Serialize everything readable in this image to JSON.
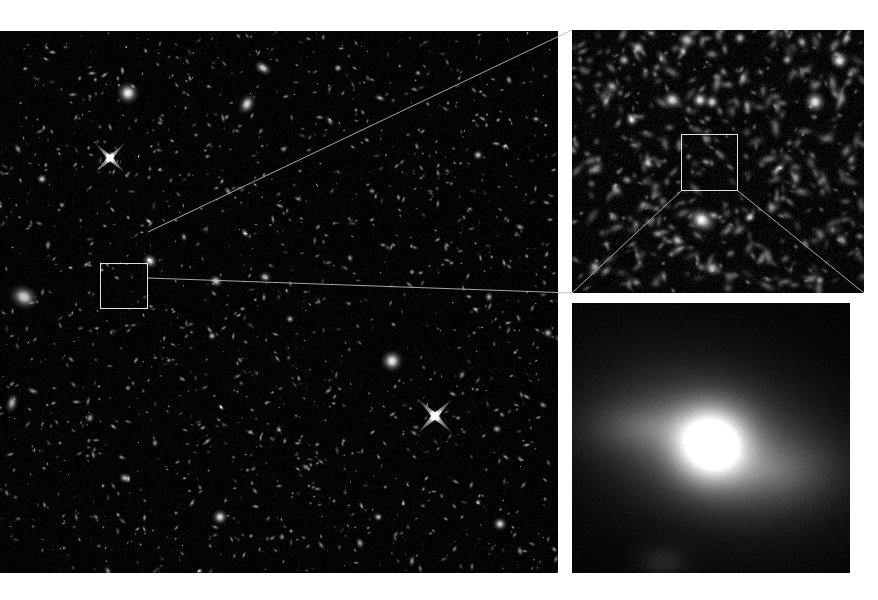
{
  "figure": {
    "background_color": "#ffffff",
    "sky_color": "#000000",
    "box_outline_color": "#e1e1e1",
    "leader_line_color": "#b9b9b9",
    "panel_count": 3
  },
  "panels": {
    "main": {
      "name": "wide-field-survey-image",
      "label": "Wide field deep survey image",
      "x": 0,
      "y": 31,
      "width": 558,
      "height": 542,
      "selection_box": {
        "x": 100,
        "y": 232,
        "width": 48,
        "height": 46
      }
    },
    "mid": {
      "name": "intermediate-zoom-image",
      "label": "Intermediate zoom cutout",
      "x": 572,
      "y": 30,
      "width": 292,
      "height": 263,
      "selection_box": {
        "x": 109,
        "y": 104,
        "width": 57,
        "height": 57
      }
    },
    "deep": {
      "name": "deep-zoom-galaxy-image",
      "label": "High magnification single galaxy",
      "x": 572,
      "y": 303,
      "width": 278,
      "height": 270
    }
  },
  "leaders": [
    {
      "name": "leader-main-to-mid-top",
      "x1": 148,
      "y1": 232,
      "x2": 572,
      "y2": 30
    },
    {
      "name": "leader-main-to-mid-bottom",
      "x1": 148,
      "y1": 278,
      "x2": 572,
      "y2": 293
    }
  ],
  "mid_leaders": [
    {
      "name": "leader-mid-to-deep-left",
      "x1": 109,
      "y1": 161,
      "x2": 0,
      "y2": 263
    },
    {
      "name": "leader-mid-to-deep-right",
      "x1": 166,
      "y1": 161,
      "x2": 292,
      "y2": 263
    }
  ],
  "chart_data": {
    "type": "scatter",
    "xlabel": "",
    "ylabel": "",
    "series": [
      {
        "name": "main-field-sources",
        "panel": "main",
        "note": "x,y in panel pixel coords; r = radius px; i = peak brightness 0-1; e = elongation; a = position angle deg; s = 1 if diffraction spikes",
        "points": [
          [
            128,
            62,
            13,
            0.95,
            1.0,
            0,
            0
          ],
          [
            263,
            37,
            7,
            0.8,
            1.6,
            35,
            0
          ],
          [
            247,
            73,
            9,
            0.85,
            1.4,
            120,
            0
          ],
          [
            338,
            37,
            5,
            0.7,
            1.0,
            0,
            0
          ],
          [
            380,
            67,
            4,
            0.65,
            1.8,
            20,
            0
          ],
          [
            418,
            42,
            4,
            0.6,
            1.0,
            0,
            0
          ],
          [
            478,
            124,
            6,
            0.75,
            1.0,
            0,
            0
          ],
          [
            509,
            49,
            4,
            0.6,
            1.5,
            70,
            0
          ],
          [
            536,
            88,
            4,
            0.62,
            1.3,
            10,
            0
          ],
          [
            110,
            127,
            7,
            0.98,
            1.0,
            0,
            1
          ],
          [
            42,
            148,
            6,
            0.78,
            1.0,
            0,
            0
          ],
          [
            18,
            118,
            4,
            0.55,
            1.8,
            60,
            0
          ],
          [
            62,
            174,
            4,
            0.58,
            1.0,
            0,
            0
          ],
          [
            24,
            266,
            14,
            0.82,
            1.25,
            25,
            0
          ],
          [
            48,
            214,
            4,
            0.55,
            1.6,
            100,
            0
          ],
          [
            150,
            230,
            8,
            0.88,
            1.15,
            40,
            0
          ],
          [
            184,
            206,
            4,
            0.6,
            1.4,
            80,
            0
          ],
          [
            216,
            250,
            7,
            0.8,
            1.2,
            25,
            0
          ],
          [
            245,
            202,
            4,
            0.58,
            1.7,
            55,
            0
          ],
          [
            265,
            246,
            6,
            0.72,
            1.25,
            10,
            0
          ],
          [
            290,
            288,
            5,
            0.7,
            1.0,
            0,
            0
          ],
          [
            298,
            168,
            3,
            0.55,
            1.9,
            30,
            0
          ],
          [
            318,
            196,
            3,
            0.52,
            1.6,
            130,
            0
          ],
          [
            350,
            227,
            4,
            0.6,
            1.3,
            75,
            0
          ],
          [
            383,
            214,
            3,
            0.5,
            1.7,
            15,
            0
          ],
          [
            412,
            241,
            4,
            0.58,
            1.0,
            0,
            0
          ],
          [
            447,
            214,
            3,
            0.52,
            1.5,
            45,
            0
          ],
          [
            489,
            266,
            5,
            0.66,
            1.2,
            90,
            0
          ],
          [
            520,
            196,
            4,
            0.58,
            1.6,
            20,
            0
          ],
          [
            545,
            236,
            3,
            0.5,
            1.0,
            0,
            0
          ],
          [
            212,
            305,
            5,
            0.74,
            1.0,
            0,
            0
          ],
          [
            240,
            329,
            3,
            0.5,
            1.5,
            60,
            0
          ],
          [
            182,
            348,
            3,
            0.52,
            1.8,
            35,
            0
          ],
          [
            128,
            357,
            4,
            0.56,
            1.0,
            0,
            0
          ],
          [
            90,
            387,
            5,
            0.62,
            1.3,
            110,
            0
          ],
          [
            60,
            412,
            3,
            0.5,
            1.0,
            0,
            0
          ],
          [
            33,
            360,
            4,
            0.55,
            1.9,
            20,
            0
          ],
          [
            12,
            372,
            7,
            0.68,
            1.7,
            105,
            0
          ],
          [
            155,
            412,
            4,
            0.56,
            1.4,
            85,
            0
          ],
          [
            125,
            447,
            6,
            0.72,
            1.2,
            15,
            0
          ],
          [
            176,
            482,
            3,
            0.5,
            1.0,
            0,
            0
          ],
          [
            96,
            486,
            3,
            0.48,
            1.6,
            40,
            0
          ],
          [
            64,
            517,
            3,
            0.48,
            1.0,
            0,
            0
          ],
          [
            108,
            540,
            4,
            0.54,
            1.7,
            65,
            0
          ],
          [
            150,
            554,
            3,
            0.48,
            1.5,
            20,
            0
          ],
          [
            200,
            540,
            4,
            0.54,
            1.0,
            0,
            0
          ],
          [
            220,
            486,
            9,
            0.88,
            1.0,
            0,
            0
          ],
          [
            255,
            460,
            3,
            0.5,
            1.8,
            50,
            0
          ],
          [
            282,
            506,
            4,
            0.55,
            1.2,
            95,
            0
          ],
          [
            306,
            436,
            4,
            0.55,
            1.6,
            25,
            0
          ],
          [
            334,
            470,
            3,
            0.5,
            1.0,
            0,
            0
          ],
          [
            360,
            512,
            5,
            0.62,
            1.4,
            70,
            0
          ],
          [
            392,
            330,
            13,
            0.92,
            1.0,
            0,
            0
          ],
          [
            435,
            385,
            8,
            0.98,
            1.0,
            0,
            1
          ],
          [
            414,
            402,
            3,
            0.5,
            1.9,
            35,
            0
          ],
          [
            462,
            344,
            4,
            0.56,
            1.5,
            120,
            0
          ],
          [
            497,
            398,
            5,
            0.64,
            1.2,
            15,
            0
          ],
          [
            478,
            471,
            4,
            0.58,
            1.0,
            0,
            0
          ],
          [
            500,
            493,
            8,
            0.84,
            1.05,
            0,
            0
          ],
          [
            520,
            428,
            3,
            0.5,
            1.7,
            60,
            0
          ],
          [
            543,
            374,
            4,
            0.55,
            1.4,
            30,
            0
          ],
          [
            545,
            468,
            3,
            0.5,
            1.0,
            0,
            0
          ],
          [
            412,
            530,
            4,
            0.55,
            1.8,
            100,
            0
          ],
          [
            455,
            556,
            3,
            0.48,
            1.3,
            20,
            0
          ],
          [
            378,
            486,
            5,
            0.6,
            1.2,
            40,
            0
          ],
          [
            520,
            520,
            4,
            0.55,
            1.6,
            75,
            0
          ],
          [
            548,
            302,
            6,
            0.68,
            1.0,
            0,
            0
          ],
          [
            330,
            90,
            4,
            0.58,
            1.7,
            55,
            0
          ],
          [
            196,
            104,
            3,
            0.52,
            1.0,
            0,
            0
          ],
          [
            160,
            92,
            3,
            0.5,
            1.5,
            25,
            0
          ],
          [
            284,
            118,
            4,
            0.56,
            1.3,
            140,
            0
          ],
          [
            300,
            140,
            3,
            0.48,
            1.0,
            0,
            0
          ],
          [
            438,
            142,
            3,
            0.5,
            1.8,
            80,
            0
          ],
          [
            470,
            178,
            3,
            0.48,
            1.4,
            30,
            0
          ],
          [
            372,
            160,
            4,
            0.54,
            1.2,
            10,
            0
          ],
          [
            228,
            160,
            4,
            0.56,
            1.6,
            50,
            0
          ]
        ]
      },
      {
        "name": "mid-field-sources",
        "panel": "mid",
        "points": [
          [
            66,
            18,
            9,
            0.75,
            1.0,
            0,
            0
          ],
          [
            115,
            10,
            10,
            0.72,
            1.2,
            20,
            0
          ],
          [
            168,
            8,
            8,
            0.66,
            1.0,
            0,
            0
          ],
          [
            230,
            12,
            7,
            0.6,
            1.3,
            60,
            0
          ],
          [
            268,
            30,
            11,
            0.78,
            1.0,
            0,
            0
          ],
          [
            52,
            30,
            8,
            0.62,
            1.0,
            0,
            0
          ],
          [
            100,
            70,
            11,
            0.82,
            1.1,
            15,
            0
          ],
          [
            128,
            70,
            10,
            0.88,
            1.0,
            0,
            0
          ],
          [
            140,
            72,
            9,
            0.8,
            1.0,
            0,
            0
          ],
          [
            175,
            76,
            6,
            0.58,
            1.6,
            80,
            0
          ],
          [
            243,
            72,
            13,
            0.9,
            1.0,
            0,
            0
          ],
          [
            60,
            90,
            8,
            0.7,
            1.0,
            0,
            0
          ],
          [
            40,
            56,
            7,
            0.55,
            1.3,
            40,
            0
          ],
          [
            134,
            132,
            5,
            0.52,
            1.5,
            30,
            0
          ],
          [
            130,
            190,
            14,
            0.86,
            1.35,
            30,
            0
          ],
          [
            178,
            187,
            7,
            0.62,
            1.0,
            0,
            0
          ],
          [
            105,
            210,
            8,
            0.6,
            1.2,
            80,
            0
          ],
          [
            86,
            204,
            6,
            0.54,
            1.5,
            10,
            0
          ],
          [
            23,
            237,
            9,
            0.64,
            1.0,
            0,
            0
          ],
          [
            140,
            238,
            10,
            0.7,
            1.0,
            0,
            0
          ],
          [
            270,
            210,
            7,
            0.56,
            1.4,
            55,
            0
          ],
          [
            248,
            250,
            6,
            0.52,
            1.0,
            0,
            0
          ],
          [
            205,
            140,
            5,
            0.48,
            1.7,
            120,
            0
          ],
          [
            55,
            150,
            6,
            0.5,
            1.3,
            25,
            0
          ],
          [
            215,
            30,
            7,
            0.58,
            1.0,
            0,
            0
          ]
        ]
      }
    ],
    "deep_galaxy": {
      "name": "magnified-galaxy",
      "panel": "deep",
      "core": {
        "x": 0.5,
        "y": 0.52,
        "radius": 0.13,
        "peak": 1.0
      },
      "halo": {
        "x": 0.5,
        "y": 0.52,
        "radius": 0.42,
        "elongation": 1.55,
        "angle": 15,
        "peak": 0.45
      },
      "faint_extension": {
        "x": 0.72,
        "y": 0.62,
        "radius": 0.3,
        "peak": 0.22
      }
    }
  }
}
